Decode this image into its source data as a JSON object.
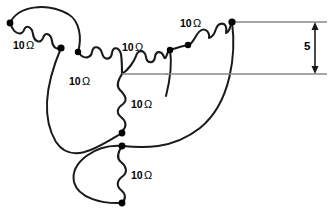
{
  "diagram": {
    "type": "electrical-circuit",
    "stroke_color": "#1a1a1a",
    "node_color": "#000000",
    "dimension_line_color": "#808080",
    "background": "#ffffff"
  },
  "resistors": [
    {
      "id": "r1",
      "label": "10",
      "unit": "Ω",
      "label_x": 13,
      "label_y": 40,
      "orientation": "diagonal",
      "branch": "upper-left"
    },
    {
      "id": "r2",
      "label": "10",
      "unit": "Ω",
      "label_x": 122,
      "label_y": 42,
      "orientation": "diagonal",
      "branch": "center-left"
    },
    {
      "id": "r3",
      "label": "10",
      "unit": "Ω",
      "label_x": 69,
      "label_y": 76,
      "orientation": "diagonal",
      "branch": "center-left-lower"
    },
    {
      "id": "r4",
      "label": "10",
      "unit": "Ω",
      "label_x": 180,
      "label_y": 18,
      "orientation": "diagonal",
      "branch": "upper-right"
    },
    {
      "id": "r5",
      "label": "10",
      "unit": "Ω",
      "label_x": 131,
      "label_y": 99,
      "orientation": "vertical",
      "branch": "center-vertical"
    },
    {
      "id": "r6",
      "label": "10",
      "unit": "Ω",
      "label_x": 131,
      "label_y": 170,
      "orientation": "vertical",
      "branch": "lower-vertical"
    }
  ],
  "nodes": [
    {
      "id": "n-left-end",
      "x": 10,
      "y": 23
    },
    {
      "id": "n-upper-left",
      "x": 61,
      "y": 48
    },
    {
      "id": "n-center-upper",
      "x": 78,
      "y": 52
    },
    {
      "id": "n-right-inner",
      "x": 170,
      "y": 50
    },
    {
      "id": "n-right-mid",
      "x": 188,
      "y": 45
    },
    {
      "id": "n-top-right",
      "x": 232,
      "y": 22
    },
    {
      "id": "n-mid-upper",
      "x": 122,
      "y": 133
    },
    {
      "id": "n-mid-lower",
      "x": 122,
      "y": 146
    },
    {
      "id": "n-bottom",
      "x": 122,
      "y": 203
    }
  ],
  "dimension": {
    "value": "5",
    "label_x": 304,
    "label_y": 41,
    "top_line_y": 22,
    "bottom_line_y": 74,
    "arrow_x": 315,
    "line_start_x": 232,
    "line_end_x": 327
  },
  "center_junction": {
    "x": 122,
    "y": 74
  }
}
